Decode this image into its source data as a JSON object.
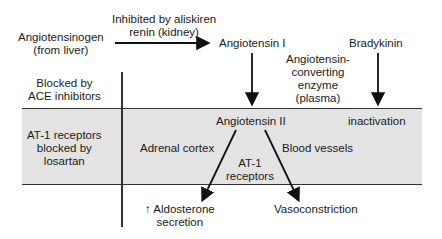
{
  "nodes": {
    "angiotensinogen": [
      "Angiotensinogen",
      "(from liver)"
    ],
    "renin": [
      "Inhibited by aliskiren",
      "renin (kidney)"
    ],
    "angiotensin_i": "Angiotensin I",
    "bradykinin": "Bradykinin",
    "ace": [
      "Angiotensin-",
      "converting",
      "enzyme",
      "(plasma)"
    ],
    "angiotensin_ii": "Angiotensin II",
    "inactivation": "inactivation",
    "adrenal_cortex": "Adrenal cortex",
    "blood_vessels": "Blood vessels",
    "at1_receptors": [
      "AT-1",
      "receptors"
    ],
    "aldosterone": [
      "↑ Aldosterone",
      "secretion"
    ],
    "vasoconstriction": "Vasoconstriction"
  },
  "side_labels": {
    "ace_inhibitors": [
      "Blocked by",
      "ACE inhibitors"
    ],
    "losartan": [
      "AT-1 receptors",
      "blocked by",
      "losartan"
    ]
  },
  "colors": {
    "band": "#e3e3e3",
    "line": "#333333"
  }
}
